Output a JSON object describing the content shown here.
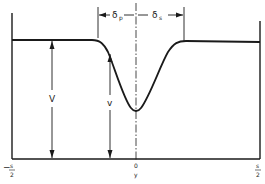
{
  "diagram": {
    "type": "cross-section profile with dip",
    "colors": {
      "line": "#1a1a1a",
      "background": "#ffffff"
    },
    "labels": {
      "delta_left": "δ",
      "delta_left_sub": "p",
      "delta_right": "δ",
      "delta_right_sub": "s",
      "outer_height": "V",
      "inner_height": "v",
      "left_edge_sign": "−",
      "left_edge_num": "s",
      "left_edge_den": "2",
      "center_top": "0",
      "center_bottom": "y",
      "right_edge_num": "s",
      "right_edge_den": "2"
    }
  }
}
